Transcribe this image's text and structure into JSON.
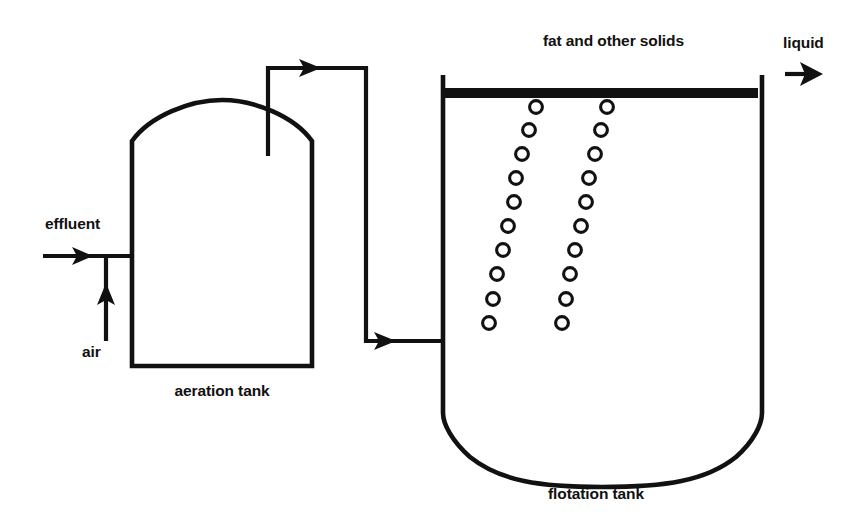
{
  "diagram": {
    "canvas": {
      "width": 865,
      "height": 524
    },
    "colors": {
      "ink": "#111111",
      "background": "#ffffff"
    },
    "labels": {
      "effluent": "effluent",
      "air": "air",
      "aeration_tank": "aeration tank",
      "fat_and_solids": "fat and other solids",
      "liquid": "liquid",
      "flotation_tank": "flotation tank"
    },
    "equipment": [
      {
        "id": "aeration-tank",
        "name": "aeration tank",
        "shape": "domed-top rectangular vessel",
        "bounds": {
          "x": 132,
          "y": 100,
          "width": 180,
          "height": 266
        }
      },
      {
        "id": "flotation-tank",
        "name": "flotation tank",
        "shape": "rectangular vessel with rounded bottom",
        "bounds": {
          "x": 443,
          "y": 75,
          "width": 319,
          "height": 408
        }
      }
    ],
    "streams": [
      {
        "id": "effluent-inlet",
        "label": "effluent",
        "direction": "right",
        "target": "aeration tank"
      },
      {
        "id": "air-inlet",
        "label": "air",
        "direction": "up",
        "target": "effluent line"
      },
      {
        "id": "transfer-line",
        "label": "",
        "direction": "up-right-down-right",
        "source": "aeration tank",
        "target": "flotation tank"
      },
      {
        "id": "liquid-outlet",
        "label": "liquid",
        "direction": "right",
        "source": "flotation tank"
      },
      {
        "id": "fat-layer",
        "label": "fat and other solids",
        "description": "floating solids layer at top of flotation tank"
      }
    ],
    "bubble_columns": {
      "count": 2,
      "bubbles_per_column": 10,
      "radius": 6.4,
      "left_column": [
        {
          "cx": 536,
          "cy": 107
        },
        {
          "cx": 529,
          "cy": 130
        },
        {
          "cx": 522,
          "cy": 154
        },
        {
          "cx": 516,
          "cy": 178
        },
        {
          "cx": 514,
          "cy": 202
        },
        {
          "cx": 508,
          "cy": 226
        },
        {
          "cx": 503,
          "cy": 250
        },
        {
          "cx": 497,
          "cy": 274
        },
        {
          "cx": 493,
          "cy": 299
        },
        {
          "cx": 489,
          "cy": 323
        }
      ],
      "right_column": [
        {
          "cx": 607,
          "cy": 107
        },
        {
          "cx": 601,
          "cy": 130
        },
        {
          "cx": 595,
          "cy": 154
        },
        {
          "cx": 589,
          "cy": 178
        },
        {
          "cx": 586,
          "cy": 202
        },
        {
          "cx": 581,
          "cy": 226
        },
        {
          "cx": 575,
          "cy": 250
        },
        {
          "cx": 570,
          "cy": 274
        },
        {
          "cx": 566,
          "cy": 299
        },
        {
          "cx": 562,
          "cy": 323
        }
      ]
    }
  }
}
